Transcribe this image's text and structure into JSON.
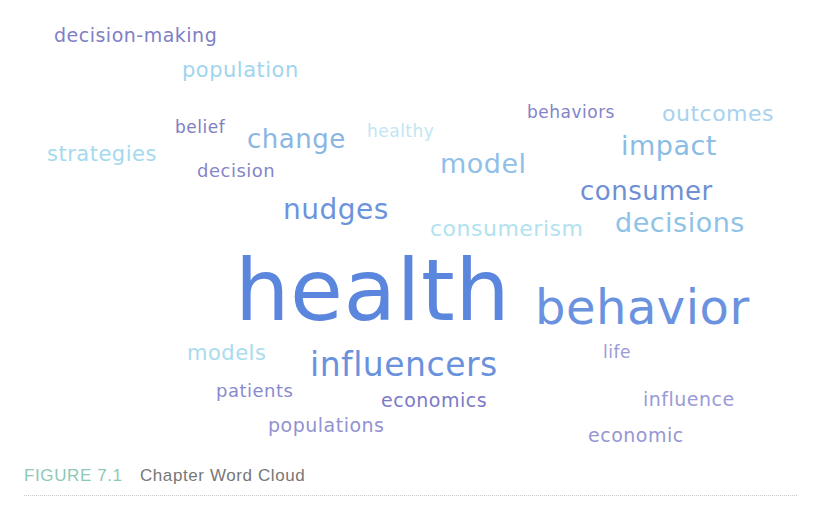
{
  "caption": {
    "figure_label": "FIGURE 7.1",
    "title": "Chapter Word Cloud"
  },
  "colors": {
    "dark_purple": "#7d7dbe",
    "purple": "#8a8ad0",
    "blue": "#5b86dd",
    "mid_blue": "#79a6e0",
    "light_blue": "#8fcbe8",
    "pale_cyan": "#aee0ec"
  },
  "words": [
    {
      "text": "decision-making",
      "x": 54,
      "y": 26,
      "size": 19,
      "color": "#8080c4"
    },
    {
      "text": "population",
      "x": 182,
      "y": 60,
      "size": 21,
      "color": "#9fd5ee"
    },
    {
      "text": "belief",
      "x": 175,
      "y": 119,
      "size": 17,
      "color": "#7e7ec0"
    },
    {
      "text": "change",
      "x": 247,
      "y": 126,
      "size": 26,
      "color": "#8ab6e4"
    },
    {
      "text": "healthy",
      "x": 367,
      "y": 123,
      "size": 17,
      "color": "#c0e6f2"
    },
    {
      "text": "behaviors",
      "x": 527,
      "y": 104,
      "size": 17,
      "color": "#8484c6"
    },
    {
      "text": "outcomes",
      "x": 662,
      "y": 103,
      "size": 22,
      "color": "#a8d2ee"
    },
    {
      "text": "strategies",
      "x": 47,
      "y": 144,
      "size": 21,
      "color": "#a4daee"
    },
    {
      "text": "decision",
      "x": 197,
      "y": 162,
      "size": 18,
      "color": "#8585c8"
    },
    {
      "text": "impact",
      "x": 621,
      "y": 132,
      "size": 27,
      "color": "#89bde6"
    },
    {
      "text": "model",
      "x": 440,
      "y": 150,
      "size": 27,
      "color": "#90c0e8"
    },
    {
      "text": "consumer",
      "x": 580,
      "y": 178,
      "size": 26,
      "color": "#6f8fd4"
    },
    {
      "text": "nudges",
      "x": 283,
      "y": 196,
      "size": 28,
      "color": "#6c94dc"
    },
    {
      "text": "consumerism",
      "x": 430,
      "y": 218,
      "size": 22,
      "color": "#b0e2ef"
    },
    {
      "text": "decisions",
      "x": 615,
      "y": 209,
      "size": 27,
      "color": "#8ec2e6"
    },
    {
      "text": "health",
      "x": 235,
      "y": 247,
      "size": 86,
      "color": "#5b86dd"
    },
    {
      "text": "behavior",
      "x": 535,
      "y": 283,
      "size": 48,
      "color": "#6a92de"
    },
    {
      "text": "models",
      "x": 187,
      "y": 343,
      "size": 21,
      "color": "#a8dcee"
    },
    {
      "text": "influencers",
      "x": 310,
      "y": 348,
      "size": 33,
      "color": "#6a92dc"
    },
    {
      "text": "life",
      "x": 603,
      "y": 344,
      "size": 17,
      "color": "#9a9ad6"
    },
    {
      "text": "patients",
      "x": 216,
      "y": 382,
      "size": 18,
      "color": "#8a8ace"
    },
    {
      "text": "economics",
      "x": 381,
      "y": 391,
      "size": 19,
      "color": "#7b7bc6"
    },
    {
      "text": "influence",
      "x": 643,
      "y": 390,
      "size": 19,
      "color": "#9a9ad6"
    },
    {
      "text": "populations",
      "x": 268,
      "y": 416,
      "size": 19,
      "color": "#9292d2"
    },
    {
      "text": "economic",
      "x": 588,
      "y": 426,
      "size": 19,
      "color": "#9696d2"
    }
  ]
}
